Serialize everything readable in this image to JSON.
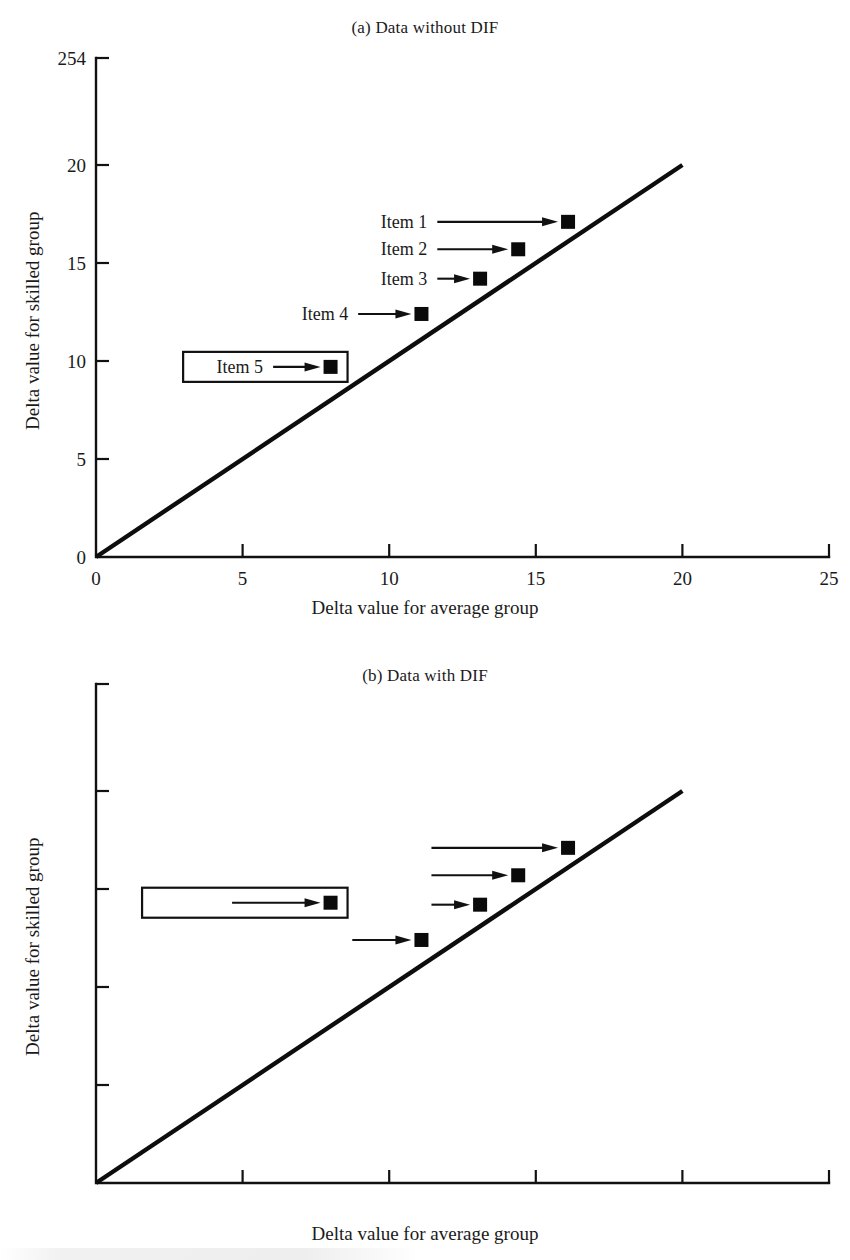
{
  "figure": {
    "axis_titles": {
      "x": "Delta value for average group",
      "y": "Delta value for skilled group"
    },
    "x_ticks": [
      "0",
      "5",
      "10",
      "15",
      "20",
      "25"
    ],
    "y_ticks": [
      "0",
      "5",
      "10",
      "15",
      "20",
      "254"
    ]
  },
  "chart_data": [
    {
      "type": "scatter",
      "panel": "a",
      "title": "(a) Data without DIF",
      "xlabel": "Delta value for average group",
      "ylabel": "Delta value for skilled group",
      "xlim": [
        0,
        25
      ],
      "ylim": [
        0,
        25
      ],
      "xticks": [
        0,
        5,
        10,
        15,
        20,
        25
      ],
      "yticks": [
        0,
        5,
        10,
        15,
        20,
        25
      ],
      "ytick_labels": [
        "0",
        "5",
        "10",
        "15",
        "20",
        "254"
      ],
      "grid": false,
      "legend": "none",
      "reference_line": {
        "name": "identity-line",
        "x": [
          0,
          20
        ],
        "y": [
          0,
          20
        ]
      },
      "points": [
        {
          "label": "Item 1",
          "x": 16.1,
          "y": 17.1,
          "boxed": false
        },
        {
          "label": "Item 2",
          "x": 14.4,
          "y": 15.7,
          "boxed": false
        },
        {
          "label": "Item 3",
          "x": 13.1,
          "y": 14.2,
          "boxed": false
        },
        {
          "label": "Item 4",
          "x": 11.1,
          "y": 12.4,
          "boxed": false
        },
        {
          "label": "Item 5",
          "x": 8.0,
          "y": 9.7,
          "boxed": true
        }
      ]
    },
    {
      "type": "scatter",
      "panel": "b",
      "title": "(b) Data with DIF",
      "xlabel": "Delta value for average group",
      "ylabel": "Delta value for skilled group",
      "xlim": [
        0,
        25
      ],
      "ylim": [
        0,
        25
      ],
      "xticks": [
        0,
        5,
        10,
        15,
        20,
        25
      ],
      "yticks": [
        0,
        5,
        10,
        15,
        20,
        25
      ],
      "ytick_labels": [
        "0",
        "5",
        "10",
        "15",
        "20",
        "254"
      ],
      "grid": false,
      "legend": "none",
      "reference_line": {
        "name": "identity-line",
        "x": [
          0,
          20
        ],
        "y": [
          0,
          20
        ]
      },
      "points": [
        {
          "label": "Item 1",
          "x": 16.1,
          "y": 17.1,
          "boxed": false
        },
        {
          "label": "Item 2",
          "x": 14.4,
          "y": 15.7,
          "boxed": false
        },
        {
          "label": "Item 3",
          "x": 13.1,
          "y": 14.2,
          "boxed": false
        },
        {
          "label": "Item 4",
          "x": 11.1,
          "y": 12.4,
          "boxed": false
        },
        {
          "label": "Item 5",
          "x": 8.0,
          "y": 14.3,
          "boxed": true
        }
      ]
    }
  ],
  "panel_a": {
    "title": "(a) Data without DIF",
    "items": [
      {
        "label": "Item 1"
      },
      {
        "label": "Item 2"
      },
      {
        "label": "Item 3"
      },
      {
        "label": "Item 4"
      },
      {
        "label": "Item 5"
      }
    ]
  },
  "panel_b": {
    "title": "(b) Data with DIF",
    "items": [
      {
        "label": "Item 1"
      },
      {
        "label": "Item 2"
      },
      {
        "label": "Item 3"
      },
      {
        "label": "Item 4"
      },
      {
        "label": "Item 5"
      }
    ]
  },
  "colors": {
    "ink": "#111111",
    "marker": "#0a0a0a",
    "background": "#ffffff"
  }
}
